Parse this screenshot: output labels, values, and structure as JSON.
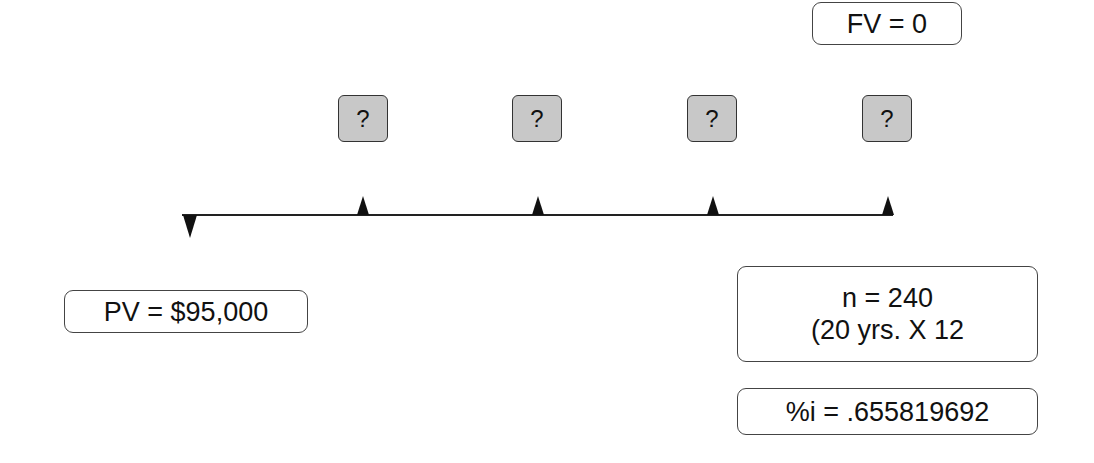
{
  "diagram": {
    "title": "",
    "future_value": {
      "label": "FV = 0"
    },
    "payments": [
      {
        "label": "?"
      },
      {
        "label": "?"
      },
      {
        "label": "?"
      },
      {
        "label": "?"
      }
    ],
    "present_value": {
      "label": "PV = $95,000"
    },
    "periods": {
      "line1": "n = 240",
      "line2": "(20 yrs. X 12"
    },
    "interest": {
      "label": "%i = .655819692"
    },
    "colors": {
      "line": "#222222",
      "box_border": "#444444",
      "payment_box_fill": "#c8c8c8",
      "background": "#ffffff"
    }
  }
}
